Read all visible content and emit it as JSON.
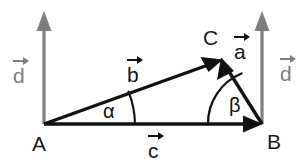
{
  "diagram": {
    "colors": {
      "stroke_dark": "#111111",
      "stroke_gray": "#7d7d7d",
      "background": "#ffffff"
    },
    "points": [
      {
        "id": "A",
        "label": "A",
        "x": 44,
        "y": 124,
        "label_x": 32,
        "label_y": 133
      },
      {
        "id": "B",
        "label": "B",
        "x": 262,
        "y": 124,
        "label_x": 267,
        "label_y": 131
      },
      {
        "id": "C",
        "label": "C",
        "x": 222,
        "y": 60,
        "label_x": 203,
        "label_y": 27
      }
    ],
    "vectors": [
      {
        "id": "c",
        "label": "c",
        "from": "A",
        "to": "B",
        "color": "dark",
        "label_x": 148,
        "label_y": 132
      },
      {
        "id": "b",
        "label": "b",
        "from": "A",
        "to": "C",
        "color": "dark",
        "label_x": 127,
        "label_y": 56
      },
      {
        "id": "a",
        "label": "a",
        "from": "B",
        "to": "C",
        "color": "dark",
        "label_x": 234,
        "label_y": 33
      },
      {
        "id": "d-left",
        "label": "d",
        "from": "A",
        "to": "up",
        "color": "gray",
        "label_x": 13,
        "label_y": 57
      },
      {
        "id": "d-right",
        "label": "d",
        "from": "B",
        "to": "up",
        "color": "gray",
        "label_x": 280,
        "label_y": 55
      }
    ],
    "angles": [
      {
        "id": "alpha",
        "label": "α",
        "at": "A",
        "between": "c-and-b",
        "label_x": 103,
        "label_y": 101
      },
      {
        "id": "beta",
        "label": "β",
        "at": "B",
        "between": "c-and-a",
        "label_x": 229,
        "label_y": 95
      }
    ]
  }
}
